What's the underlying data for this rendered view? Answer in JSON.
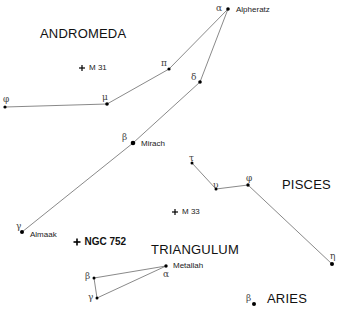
{
  "constellations": [
    {
      "name": "ANDROMEDA",
      "x": 40,
      "y": 27
    },
    {
      "name": "PISCES",
      "x": 282,
      "y": 178
    },
    {
      "name": "TRIANGULUM",
      "x": 151,
      "y": 243
    },
    {
      "name": "ARIES",
      "x": 267,
      "y": 292
    }
  ],
  "stars": [
    {
      "id": "and-alpha",
      "greek": "α",
      "name": "Alpheratz",
      "x": 228,
      "y": 9,
      "r": 1.8,
      "gx": 216,
      "gy": 4,
      "nx": 236,
      "ny": 6
    },
    {
      "id": "and-pi",
      "greek": "π",
      "name": "",
      "x": 169,
      "y": 69,
      "r": 1.6,
      "gx": 161,
      "gy": 59
    },
    {
      "id": "and-delta",
      "greek": "δ",
      "name": "",
      "x": 200,
      "y": 82,
      "r": 1.8,
      "gx": 191,
      "gy": 73
    },
    {
      "id": "and-mu",
      "greek": "μ",
      "name": "",
      "x": 107,
      "y": 104,
      "r": 1.8,
      "gx": 102,
      "gy": 93
    },
    {
      "id": "and-phi",
      "greek": "φ",
      "name": "",
      "x": 5,
      "y": 107,
      "r": 1.6,
      "gx": 3,
      "gy": 95
    },
    {
      "id": "and-beta",
      "greek": "β",
      "name": "Mirach",
      "x": 133,
      "y": 143,
      "r": 2.3,
      "gx": 122,
      "gy": 133,
      "nx": 141,
      "ny": 140
    },
    {
      "id": "and-gamma",
      "greek": "γ",
      "name": "Almaak",
      "x": 22,
      "y": 232,
      "r": 2.0,
      "gx": 16,
      "gy": 222,
      "nx": 30,
      "ny": 231
    },
    {
      "id": "psc-tau",
      "greek": "τ",
      "name": "",
      "x": 192,
      "y": 163,
      "r": 1.5,
      "gx": 189,
      "gy": 154
    },
    {
      "id": "psc-upsilon",
      "greek": "υ",
      "name": "",
      "x": 216,
      "y": 189,
      "r": 1.5,
      "gx": 213,
      "gy": 181
    },
    {
      "id": "psc-phi",
      "greek": "φ",
      "name": "",
      "x": 248,
      "y": 185,
      "r": 1.7,
      "gx": 246,
      "gy": 174
    },
    {
      "id": "psc-eta",
      "greek": "η",
      "name": "",
      "x": 332,
      "y": 264,
      "r": 2.0,
      "gx": 330,
      "gy": 252
    },
    {
      "id": "tri-alpha",
      "greek": "α",
      "name": "Metallah",
      "x": 166,
      "y": 266,
      "r": 1.7,
      "gx": 163,
      "gy": 270,
      "nx": 173,
      "ny": 262
    },
    {
      "id": "tri-beta",
      "greek": "β",
      "name": "",
      "x": 94,
      "y": 278,
      "r": 1.5,
      "gx": 85,
      "gy": 272
    },
    {
      "id": "tri-gamma",
      "greek": "γ",
      "name": "",
      "x": 97,
      "y": 298,
      "r": 1.5,
      "gx": 88,
      "gy": 293
    },
    {
      "id": "ari-beta",
      "greek": "β",
      "name": "",
      "x": 254,
      "y": 304,
      "r": 2.0,
      "gx": 246,
      "gy": 294
    }
  ],
  "lines": [
    [
      "and-phi",
      "and-mu"
    ],
    [
      "and-mu",
      "and-pi"
    ],
    [
      "and-pi",
      "and-alpha"
    ],
    [
      "and-alpha",
      "and-delta"
    ],
    [
      "and-delta",
      "and-beta"
    ],
    [
      "and-beta",
      "and-gamma"
    ],
    [
      "psc-tau",
      "psc-upsilon"
    ],
    [
      "psc-upsilon",
      "psc-phi"
    ],
    [
      "psc-phi",
      "psc-eta"
    ],
    [
      "tri-beta",
      "tri-alpha"
    ],
    [
      "tri-alpha",
      "tri-gamma"
    ],
    [
      "tri-beta",
      "tri-gamma"
    ]
  ],
  "deep_sky": [
    {
      "id": "m31",
      "label": "M 31",
      "x": 82,
      "y": 68,
      "size": 3,
      "bold": false
    },
    {
      "id": "m33",
      "label": "M 33",
      "x": 175,
      "y": 212,
      "size": 3,
      "bold": false
    },
    {
      "id": "ngc752",
      "label": "NGC 752",
      "x": 77,
      "y": 242,
      "size": 3.5,
      "bold": true
    }
  ],
  "colors": {
    "line": "#6b6b6b",
    "star": "#000000",
    "background": "#ffffff"
  }
}
